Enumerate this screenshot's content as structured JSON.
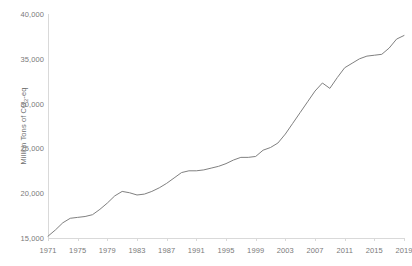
{
  "chart_data": {
    "type": "line",
    "title": "",
    "subtitle": "",
    "xlabel": "",
    "ylabel": "Million Tons of CO2-eq",
    "ylabel_parts": {
      "pre": "Million Tons of CO",
      "sub": "2",
      "post": "-eq"
    },
    "xlim": [
      1971,
      2019
    ],
    "ylim": [
      15000,
      40000
    ],
    "ytick_values": [
      40000,
      35000,
      30000,
      25000,
      20000,
      15000
    ],
    "ytick_labels": [
      "40,000",
      "35,000",
      "30,000",
      "25,000",
      "20,000",
      "15,000"
    ],
    "xtick_values": [
      1971,
      1975,
      1979,
      1983,
      1987,
      1991,
      1995,
      1999,
      2003,
      2007,
      2011,
      2015,
      2019
    ],
    "xtick_labels": [
      "1971",
      "1975",
      "1979",
      "1983",
      "1987",
      "1991",
      "1995",
      "1999",
      "2003",
      "2007",
      "2011",
      "2015",
      "2019"
    ],
    "grid": false,
    "legend": false,
    "legend_position": "none",
    "markers": false,
    "line_color": "#808080",
    "line_width": 1,
    "axis_color": "#d9d9d9",
    "tick_label_color": "#7a7a7a",
    "background_color": "#ffffff",
    "x": [
      1971,
      1972,
      1973,
      1974,
      1975,
      1976,
      1977,
      1978,
      1979,
      1980,
      1981,
      1982,
      1983,
      1984,
      1985,
      1986,
      1987,
      1988,
      1989,
      1990,
      1991,
      1992,
      1993,
      1994,
      1995,
      1996,
      1997,
      1998,
      1999,
      2000,
      2001,
      2002,
      2003,
      2004,
      2005,
      2006,
      2007,
      2008,
      2009,
      2010,
      2011,
      2012,
      2013,
      2014,
      2015,
      2016,
      2017,
      2018,
      2019
    ],
    "values": [
      15200,
      15900,
      16700,
      17200,
      17300,
      17400,
      17600,
      18200,
      18900,
      19700,
      20200,
      20050,
      19800,
      19900,
      20200,
      20600,
      21100,
      21700,
      22300,
      22500,
      22500,
      22600,
      22800,
      23000,
      23300,
      23700,
      24000,
      24000,
      24100,
      24800,
      25100,
      25600,
      26600,
      27800,
      29000,
      30200,
      31400,
      32300,
      31700,
      32900,
      34000,
      34500,
      35000,
      35300,
      35400,
      35500,
      36200,
      37200,
      37600
    ],
    "series": [
      {
        "name": "Global greenhouse gas emissions",
        "color": "#808080",
        "values": [
          15200,
          15900,
          16700,
          17200,
          17300,
          17400,
          17600,
          18200,
          18900,
          19700,
          20200,
          20050,
          19800,
          19900,
          20200,
          20600,
          21100,
          21700,
          22300,
          22500,
          22500,
          22600,
          22800,
          23000,
          23300,
          23700,
          24000,
          24000,
          24100,
          24800,
          25100,
          25600,
          26600,
          27800,
          29000,
          30200,
          31400,
          32300,
          31700,
          32900,
          34000,
          34500,
          35000,
          35300,
          35400,
          35500,
          36200,
          37200,
          37600
        ]
      }
    ],
    "annotations": []
  }
}
